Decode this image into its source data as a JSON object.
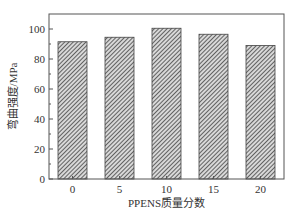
{
  "chart_data": {
    "type": "bar",
    "title": "",
    "xlabel": "PPENS质量分数",
    "ylabel": "弯曲强度/MPa",
    "categories": [
      "0",
      "5",
      "10",
      "15",
      "20"
    ],
    "values": [
      91.5,
      94.5,
      100.5,
      96.5,
      89
    ],
    "ylim": [
      0,
      110
    ],
    "yticks": [
      0,
      20,
      40,
      60,
      80,
      100
    ],
    "grid": false,
    "legend": null,
    "bar_style": "diagonal hatch, gray",
    "colors": {
      "bar_fill": "#9a9a9a",
      "hatch": "#444444",
      "axis": "#555555"
    }
  }
}
